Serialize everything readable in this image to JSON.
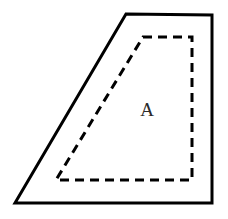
{
  "figure": {
    "canvas": {
      "width": 228,
      "height": 219,
      "background": "#ffffff"
    },
    "outer_shape": {
      "name": "solid-quadrilateral",
      "stroke_color": "#000000",
      "stroke_width": 3,
      "fill": "none",
      "line_style": "solid",
      "points": "126,14 212,15 212,203 15,203",
      "vertices": [
        {
          "label": "top-left",
          "x": 126,
          "y": 14
        },
        {
          "label": "top-right",
          "x": 212,
          "y": 15
        },
        {
          "label": "bottom-right",
          "x": 212,
          "y": 203
        },
        {
          "label": "bottom-left",
          "x": 15,
          "y": 203
        }
      ]
    },
    "inner_shape": {
      "name": "dashed-quadrilateral",
      "stroke_color": "#000000",
      "stroke_width": 3,
      "fill": "none",
      "line_style": "dashed",
      "dash_pattern": "9 6",
      "points": "143,37 192,37 192,180 56,180",
      "vertices": [
        {
          "label": "top-left",
          "x": 143,
          "y": 37
        },
        {
          "label": "top-right",
          "x": 192,
          "y": 37
        },
        {
          "label": "bottom-right",
          "x": 192,
          "y": 180
        },
        {
          "label": "bottom-left",
          "x": 56,
          "y": 180
        }
      ]
    },
    "labels": [
      {
        "name": "region-label-a",
        "text": "A",
        "x": 147,
        "y": 112,
        "color": "#2b2b2b",
        "font_size": 19
      }
    ]
  }
}
